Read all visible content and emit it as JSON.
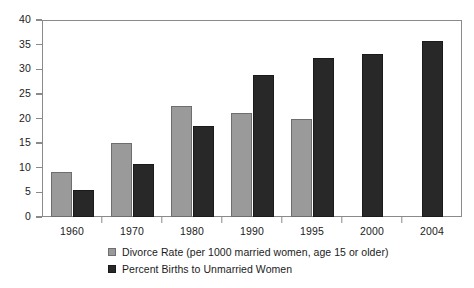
{
  "chart_data": {
    "type": "bar",
    "title": "",
    "xlabel": "",
    "ylabel": "",
    "ylim": [
      0,
      40
    ],
    "ytick_step": 5,
    "yticks": [
      "0",
      "5",
      "10",
      "15",
      "20",
      "25",
      "30",
      "35",
      "40"
    ],
    "grid": false,
    "legend_position": "bottom-left",
    "categories": [
      "1960",
      "1970",
      "1980",
      "1990",
      "1995",
      "2000",
      "2004"
    ],
    "series": [
      {
        "name": "Divorce Rate (per 1000 married women, age 15 or older)",
        "color": "#9a9a9a",
        "values": [
          9.2,
          15.0,
          22.6,
          21.1,
          20.0,
          null,
          null
        ]
      },
      {
        "name": "Percent Births to Unmarried Women",
        "color": "#282828",
        "values": [
          5.5,
          10.7,
          18.4,
          28.8,
          32.2,
          33.0,
          35.7
        ]
      }
    ]
  },
  "axis": {
    "axis_color": "#8a8a8a",
    "text_color": "#1b1b1b"
  }
}
